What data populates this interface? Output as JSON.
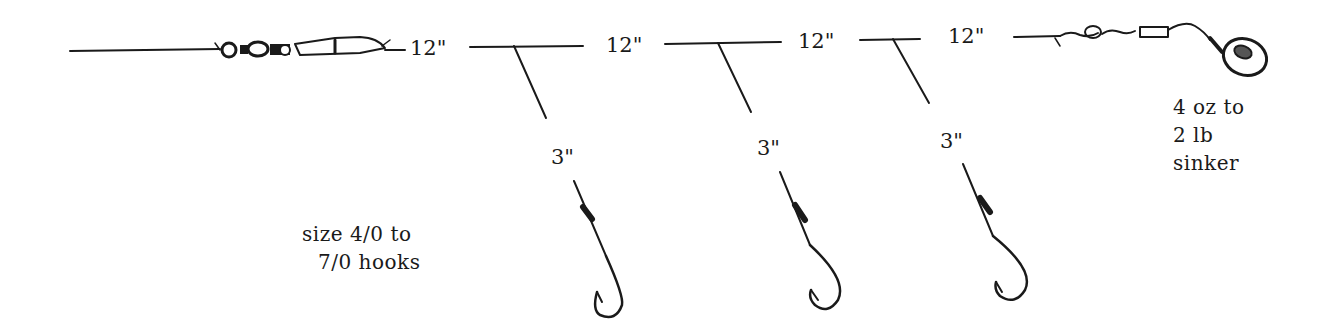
{
  "diagram": {
    "type": "fishing-rig",
    "main_line": {
      "segment_labels": [
        "12\"",
        "12\"",
        "12\"",
        "12\""
      ]
    },
    "droppers": [
      {
        "length_label": "3\""
      },
      {
        "length_label": "3\""
      },
      {
        "length_label": "3\""
      }
    ],
    "hooks_note": {
      "line1": "size 4/0 to",
      "line2": "7/0 hooks"
    },
    "sinker_note": {
      "line1": "4 oz to",
      "line2": "2 lb",
      "line3": "sinker"
    },
    "colors": {
      "ink": "#1a1a1a",
      "background": "#ffffff"
    }
  }
}
